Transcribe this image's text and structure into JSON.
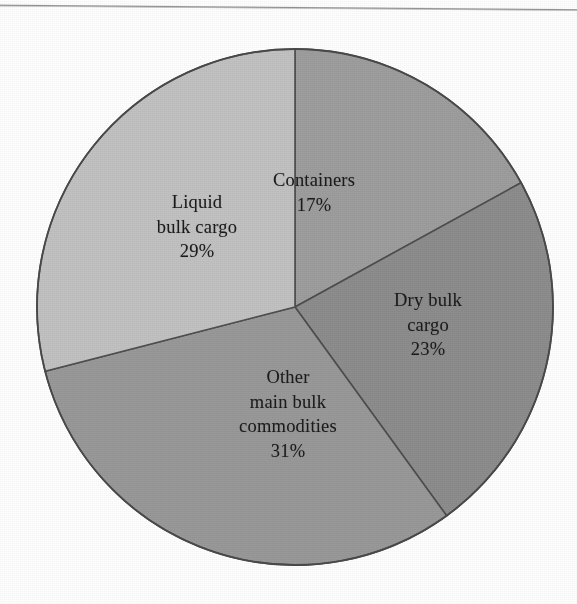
{
  "figure": {
    "background_color": "#ffffff",
    "outline_color": "#4a4a4a"
  },
  "chart_data": {
    "type": "pie",
    "title": "",
    "subtitle": "",
    "xlabel": "",
    "ylabel": "",
    "legend_position": "none",
    "grid": false,
    "labels_inside": true,
    "start_angle_deg": 0,
    "direction": "clockwise",
    "center": {
      "x": 295,
      "y": 307
    },
    "radius": 258,
    "categories": [
      "Containers",
      "Dry bulk cargo",
      "Other main bulk commodities",
      "Liquid bulk cargo"
    ],
    "values": [
      17,
      23,
      31,
      29
    ],
    "unit": "%",
    "slices": [
      {
        "name": "Containers",
        "value": 17,
        "value_text": "17%",
        "label_lines": [
          "Containers"
        ],
        "color": "#9e9e9e",
        "start_deg": 0,
        "end_deg": 61.2
      },
      {
        "name": "Dry bulk cargo",
        "value": 23,
        "value_text": "23%",
        "label_lines": [
          "Dry bulk",
          "cargo"
        ],
        "color": "#8d8d8d",
        "start_deg": 61.2,
        "end_deg": 144.0
      },
      {
        "name": "Other main bulk commodities",
        "value": 31,
        "value_text": "31%",
        "label_lines": [
          "Other",
          "main bulk",
          "commodities"
        ],
        "color": "#999999",
        "start_deg": 144.0,
        "end_deg": 255.6
      },
      {
        "name": "Liquid bulk cargo",
        "value": 29,
        "value_text": "29%",
        "label_lines": [
          "Liquid",
          "bulk cargo"
        ],
        "color": "#c2c2c2",
        "start_deg": 255.6,
        "end_deg": 360.0
      }
    ]
  },
  "labels": {
    "containers": {
      "line1": "Containers",
      "percent": "17%"
    },
    "dry_bulk": {
      "line1": "Dry bulk",
      "line2": "cargo",
      "percent": "23%"
    },
    "other_bulk": {
      "line1": "Other",
      "line2": "main bulk",
      "line3": "commodities",
      "percent": "31%"
    },
    "liquid_bulk": {
      "line1": "Liquid",
      "line2": "bulk cargo",
      "percent": "29%"
    }
  }
}
